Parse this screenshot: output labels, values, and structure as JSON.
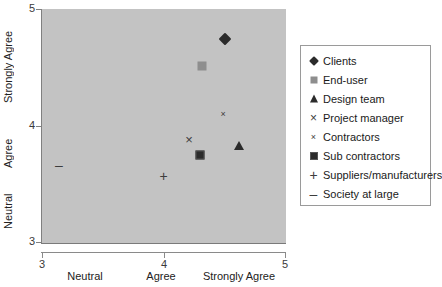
{
  "chart_data": {
    "type": "scatter",
    "title": "",
    "xlabel": "",
    "ylabel": "",
    "xlim": [
      3,
      5
    ],
    "ylim": [
      3,
      5
    ],
    "grid": false,
    "legend_position": "right",
    "x_ticks": [
      "3",
      "4",
      "5"
    ],
    "x_tick_values": [
      3,
      4,
      5
    ],
    "y_ticks": [
      "5",
      "4",
      "3"
    ],
    "y_tick_values": [
      5,
      4,
      3
    ],
    "x_category_labels": [
      "Neutral",
      "Agree",
      "Strongly Agree"
    ],
    "y_category_labels": [
      "Strongly Agree",
      "Agree",
      "Neutral"
    ],
    "series": [
      {
        "name": "Clients",
        "marker": "diamond",
        "x": 4.51,
        "y": 4.74,
        "color": "#2b2b2b"
      },
      {
        "name": "End-user",
        "marker": "square-open",
        "x": 4.32,
        "y": 4.51,
        "color": "#8e8e8e"
      },
      {
        "name": "Design team",
        "marker": "triangle",
        "x": 4.62,
        "y": 3.82,
        "color": "#2b2b2b"
      },
      {
        "name": "Project manager",
        "marker": "x-big",
        "x": 4.21,
        "y": 3.88,
        "color": "#3d3d3d"
      },
      {
        "name": "Contractors",
        "marker": "x-small",
        "x": 4.49,
        "y": 4.1,
        "color": "#3d3d3d"
      },
      {
        "name": "Sub contractors",
        "marker": "square-filled",
        "x": 4.3,
        "y": 3.75,
        "color": "#2b2b2b"
      },
      {
        "name": "Suppliers/manufacturers",
        "marker": "plus",
        "x": 4.0,
        "y": 3.57,
        "color": "#3d3d3d"
      },
      {
        "name": "Society at large",
        "marker": "dash",
        "x": 3.14,
        "y": 3.66,
        "color": "#3d3d3d"
      }
    ]
  },
  "legend": {
    "items": [
      {
        "label": "Clients",
        "glyph": "♦"
      },
      {
        "label": "End-user",
        "glyph": "■"
      },
      {
        "label": "Design team",
        "glyph": "▲"
      },
      {
        "label": "Project manager",
        "glyph": "×"
      },
      {
        "label": "Contractors",
        "glyph": "×"
      },
      {
        "label": "Sub contractors",
        "glyph": "■"
      },
      {
        "label": "Suppliers/manufacturers",
        "glyph": "+"
      },
      {
        "label": "Society at large",
        "glyph": "–"
      }
    ]
  },
  "colors": {
    "plot_background": "#c3c3c3",
    "axis": "#808080",
    "legend_border": "#9a9a9a",
    "marker_dark": "#2b2b2b",
    "marker_gray": "#8e8e8e"
  }
}
